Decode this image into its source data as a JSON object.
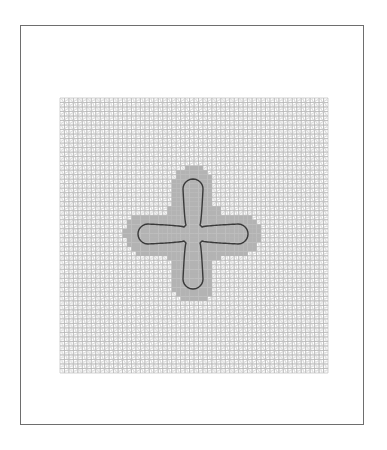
{
  "figure": {
    "kind": "finite-element-mesh",
    "frame": {
      "x": 20,
      "y": 25,
      "width": 344,
      "height": 400,
      "stroke": "#6e6e6e"
    },
    "mesh": {
      "x": 60,
      "y": 98,
      "width": 268,
      "height": 275,
      "cols": 60,
      "rows": 61,
      "line_color": "#b4b4b4",
      "diagonal_color": "#c8c8c8",
      "refined_fill": "#b3b3b3"
    },
    "refined_region": {
      "shape": "cross",
      "center": [
        193,
        234
      ],
      "arm_half_width": 21,
      "extent": {
        "left": 125,
        "right": 262,
        "top": 168,
        "bottom": 305
      }
    },
    "interface_curve": {
      "shape": "four-lobed cross",
      "color": "#3a3a3a",
      "center": [
        193,
        234
      ],
      "lobe_tip_radius": 55,
      "neck_half_width": 7,
      "lobe_half_width": 10
    }
  }
}
